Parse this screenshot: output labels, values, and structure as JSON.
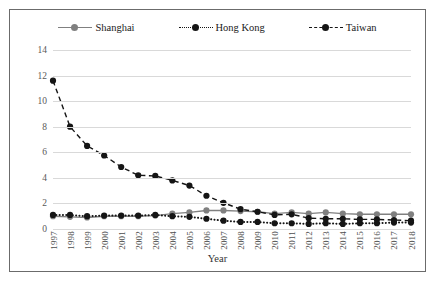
{
  "chart_data": {
    "type": "line",
    "title": "",
    "xlabel": "Year",
    "ylabel": "",
    "ylim": [
      0,
      14
    ],
    "yticks": [
      0,
      2,
      4,
      6,
      8,
      10,
      12,
      14
    ],
    "grid": true,
    "legend_position": "top-center",
    "categories": [
      "1997",
      "1998",
      "1999",
      "2000",
      "2001",
      "2002",
      "2003",
      "2004",
      "2005",
      "2006",
      "2007",
      "2008",
      "2009",
      "2010",
      "2011",
      "2012",
      "2013",
      "2014",
      "2015",
      "2016",
      "2017",
      "2018"
    ],
    "series": [
      {
        "name": "Shanghai",
        "style": "solid",
        "color": "#808080",
        "marker": "circle",
        "values": [
          1.0,
          0.95,
          0.9,
          1.0,
          1.0,
          1.0,
          1.05,
          1.2,
          1.3,
          1.45,
          1.45,
          1.4,
          1.35,
          1.2,
          1.3,
          1.2,
          1.3,
          1.2,
          1.15,
          1.15,
          1.15,
          1.15
        ]
      },
      {
        "name": "Hong Kong",
        "style": "dotted",
        "color": "#151515",
        "marker": "circle",
        "values": [
          1.1,
          1.1,
          1.0,
          1.05,
          1.05,
          1.05,
          1.1,
          1.0,
          0.95,
          0.8,
          0.65,
          0.55,
          0.55,
          0.45,
          0.45,
          0.4,
          0.45,
          0.4,
          0.45,
          0.45,
          0.5,
          0.5
        ]
      },
      {
        "name": "Taiwan",
        "style": "dashed",
        "color": "#151515",
        "marker": "circle",
        "values": [
          11.6,
          8.0,
          6.5,
          5.75,
          4.85,
          4.2,
          4.15,
          3.8,
          3.4,
          2.6,
          2.05,
          1.55,
          1.35,
          1.1,
          1.15,
          0.85,
          0.8,
          0.8,
          0.75,
          0.75,
          0.7,
          0.65
        ]
      }
    ]
  },
  "legend": {
    "items": [
      {
        "label": "Shanghai",
        "style": "solid",
        "color": "#808080"
      },
      {
        "label": "Hong Kong",
        "style": "dotted",
        "color": "#151515"
      },
      {
        "label": "Taiwan",
        "style": "dashed",
        "color": "#151515"
      }
    ]
  },
  "axis": {
    "x_title": "Year"
  },
  "caption": {
    "text": ""
  }
}
